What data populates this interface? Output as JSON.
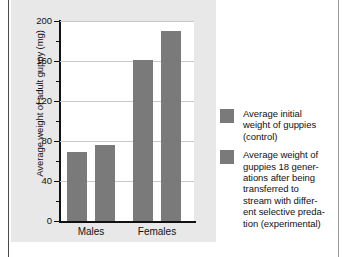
{
  "chart_data": {
    "type": "bar",
    "title": "",
    "xlabel": "",
    "ylabel": "Average weight of adult guppy (mg)",
    "categories": [
      "Males",
      "Females"
    ],
    "ylim": [
      0,
      200
    ],
    "yticks": [
      0,
      40,
      80,
      120,
      160,
      200
    ],
    "ytick_labels": [
      "0",
      "40",
      "80",
      "120",
      "160",
      "200"
    ],
    "minor_tick_step": 20,
    "grid": true,
    "grid_axis": "y",
    "legend_position": "right",
    "bar_color": "#7a7a7a",
    "plot_background": "#ffffff",
    "panel_background": "#e8e8e8",
    "series": [
      {
        "name": "Average initial weight of guppies (control)",
        "values": [
          69,
          161
        ]
      },
      {
        "name": "Average weight of guppies 18 generations after being transferred to stream with different selective predation (experimental)",
        "values": [
          76,
          190
        ]
      }
    ]
  },
  "legend": {
    "items": [
      {
        "swatch_color": "#7a7a7a",
        "lines": [
          "Average initial",
          "weight of guppies",
          "(control)"
        ]
      },
      {
        "swatch_color": "#7a7a7a",
        "lines": [
          "Average weight of",
          "guppies 18 gener-",
          "ations after being",
          "transferred to",
          "stream with differ-",
          "ent selective preda-",
          "tion (experimental)"
        ]
      }
    ]
  }
}
